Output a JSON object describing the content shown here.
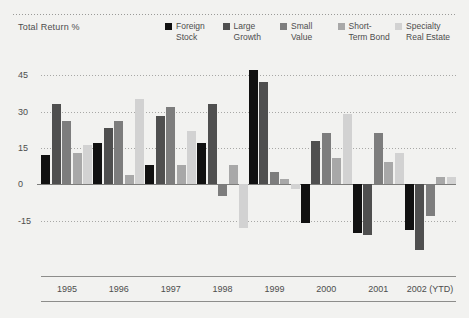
{
  "header": {
    "axis_title": "Total Return %"
  },
  "legend": {
    "position": "top-right",
    "entries": [
      {
        "label": "Foreign\nStock",
        "color": "#111111"
      },
      {
        "label": "Large\nGrowth",
        "color": "#4f4f4f"
      },
      {
        "label": "Small\nValue",
        "color": "#7d7d7d"
      },
      {
        "label": "Short-\nTerm Bond",
        "color": "#a8a8a8"
      },
      {
        "label": "Specialty\nReal Estate",
        "color": "#d2d2d2"
      }
    ]
  },
  "yaxis": {
    "ticks": [
      "45",
      "30",
      "15",
      "0",
      "-15"
    ]
  },
  "chart_data": {
    "type": "bar",
    "title": "Total Return %",
    "xlabel": "",
    "ylabel": "Total Return %",
    "ylim": [
      -30,
      50
    ],
    "grid": true,
    "yticks": [
      45,
      30,
      15,
      0,
      -15
    ],
    "categories": [
      "1995",
      "1996",
      "1997",
      "1998",
      "1999",
      "2000",
      "2001",
      "2002 (YTD)"
    ],
    "series": [
      {
        "name": "Foreign Stock",
        "color": "#111111",
        "values": [
          12,
          17,
          8,
          17,
          47,
          -16,
          -20,
          -19
        ]
      },
      {
        "name": "Large Growth",
        "color": "#4f4f4f",
        "values": [
          33,
          23,
          28,
          33,
          42,
          18,
          -21,
          -27
        ]
      },
      {
        "name": "Small Value",
        "color": "#7d7d7d",
        "values": [
          26,
          26,
          32,
          -5,
          5,
          21,
          21,
          -13
        ]
      },
      {
        "name": "Short-Term Bond",
        "color": "#a8a8a8",
        "values": [
          13,
          4,
          8,
          8,
          2,
          11,
          9,
          3
        ]
      },
      {
        "name": "Specialty Real Estate",
        "color": "#d2d2d2",
        "values": [
          16,
          35,
          22,
          -18,
          -2,
          29,
          13,
          3
        ]
      }
    ]
  }
}
